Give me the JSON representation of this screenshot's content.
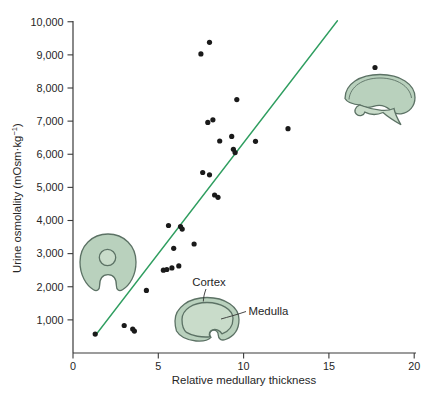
{
  "colors": {
    "trend_line": "#2f9e60",
    "point": "#1a1a1a",
    "axis": "#3a3a3a",
    "kidney_fill": "#b9d1bd",
    "kidney_inner_fill": "#c9dcca",
    "kidney_outline": "#5c7265"
  },
  "chart_data": {
    "type": "scatter",
    "title": "",
    "xlabel": "Relative medullary thickness",
    "ylabel": "Urine osmolality (mOsm·kg−1)",
    "ylabel_parts": {
      "main": "Urine osmolality (mOsm·kg",
      "sup": "−1",
      "close": ")"
    },
    "xlim": [
      0,
      20
    ],
    "ylim": [
      0,
      10000
    ],
    "grid": false,
    "x_ticks": [
      {
        "value": 0,
        "label": "0"
      },
      {
        "value": 5,
        "label": "5"
      },
      {
        "value": 10,
        "label": "10"
      },
      {
        "value": 15,
        "label": "15"
      },
      {
        "value": 20,
        "label": "20"
      }
    ],
    "y_ticks": [
      {
        "value": 1000,
        "label": "1,000"
      },
      {
        "value": 2000,
        "label": "2,000"
      },
      {
        "value": 3000,
        "label": "3,000"
      },
      {
        "value": 4000,
        "label": "4,000"
      },
      {
        "value": 5000,
        "label": "5,000"
      },
      {
        "value": 6000,
        "label": "6,000"
      },
      {
        "value": 7000,
        "label": "7,000"
      },
      {
        "value": 8000,
        "label": "8,000"
      },
      {
        "value": 9000,
        "label": "9,000"
      },
      {
        "value": 10000,
        "label": "10,000"
      }
    ],
    "points": [
      [
        1.3,
        570
      ],
      [
        3.0,
        830
      ],
      [
        3.5,
        720
      ],
      [
        3.6,
        660
      ],
      [
        4.3,
        1890
      ],
      [
        5.3,
        2500
      ],
      [
        5.5,
        2520
      ],
      [
        5.8,
        2570
      ],
      [
        6.2,
        2630
      ],
      [
        5.6,
        3850
      ],
      [
        5.9,
        3160
      ],
      [
        6.3,
        3820
      ],
      [
        6.4,
        3740
      ],
      [
        7.1,
        3290
      ],
      [
        7.5,
        9030
      ],
      [
        7.6,
        5450
      ],
      [
        7.9,
        6960
      ],
      [
        8.0,
        5380
      ],
      [
        8.0,
        9380
      ],
      [
        8.2,
        7040
      ],
      [
        8.3,
        4770
      ],
      [
        8.5,
        4700
      ],
      [
        8.6,
        6400
      ],
      [
        9.3,
        6540
      ],
      [
        9.4,
        6150
      ],
      [
        9.5,
        6050
      ],
      [
        9.6,
        7650
      ],
      [
        10.7,
        6390
      ],
      [
        12.6,
        6770
      ],
      [
        17.7,
        8620
      ]
    ],
    "trendline": {
      "x1": 1.4,
      "y1": 590,
      "x2": 15.5,
      "y2": 10030
    },
    "annotations": [
      {
        "id": "cortex",
        "label": "Cortex"
      },
      {
        "id": "medulla",
        "label": "Medulla"
      }
    ],
    "legend": null
  }
}
